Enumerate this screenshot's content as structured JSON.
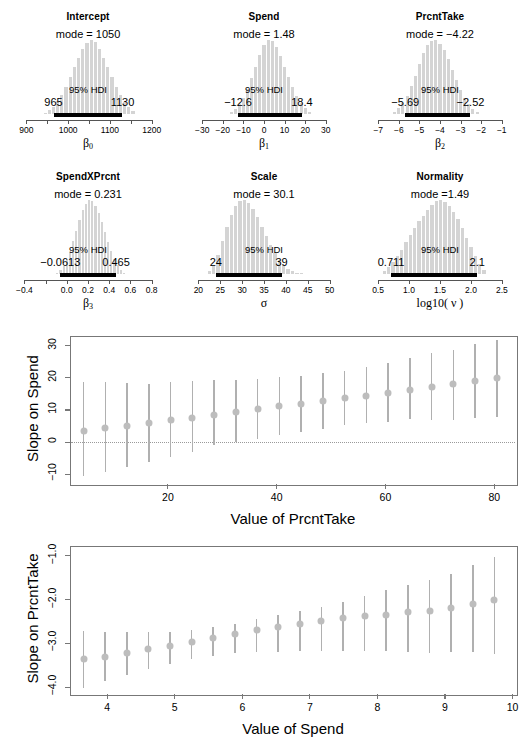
{
  "chart_data": [
    {
      "type": "bar",
      "panel": "posterior-histogram",
      "title": "Intercept",
      "mode_label": "mode = 1050",
      "hdi_label": "95% HDI",
      "hdi_low": "965",
      "hdi_high": "1130",
      "hdi_low_value": 965,
      "hdi_high_value": 1130,
      "mode_value": 1050,
      "xlabel": "β₀",
      "xlabel_base": "β",
      "xlabel_sub": "0",
      "xlim": [
        880,
        1215
      ],
      "ticks": [
        900,
        1000,
        1100,
        1200
      ],
      "ticklabels": [
        "900",
        "1000",
        "1100",
        "1200"
      ],
      "minor_ticks": [
        950,
        1050,
        1150
      ],
      "bin_centers": [
        945,
        955,
        965,
        975,
        985,
        995,
        1005,
        1015,
        1025,
        1035,
        1045,
        1055,
        1065,
        1075,
        1085,
        1095,
        1105,
        1115,
        1125,
        1135,
        1145,
        1155
      ],
      "values": [
        2,
        5,
        10,
        17,
        26,
        37,
        50,
        63,
        76,
        88,
        96,
        100,
        97,
        88,
        76,
        63,
        50,
        37,
        26,
        16,
        9,
        4
      ]
    },
    {
      "type": "bar",
      "panel": "posterior-histogram",
      "title": "Spend",
      "mode_label": "mode = 1.48",
      "hdi_label": "95% HDI",
      "hdi_low": "−12.6",
      "hdi_high": "18.4",
      "hdi_low_value": -12.6,
      "hdi_high_value": 18.4,
      "mode_value": 1.48,
      "xlabel": "β₁",
      "xlabel_base": "β",
      "xlabel_sub": "1",
      "xlim": [
        -34,
        34
      ],
      "ticks": [
        -30,
        -20,
        -10,
        0,
        10,
        20,
        30
      ],
      "ticklabels": [
        "−30",
        "−20",
        "−10",
        "0",
        "10",
        "20",
        "30"
      ],
      "minor_ticks": [],
      "bin_centers": [
        -16,
        -14,
        -12,
        -10,
        -8,
        -6,
        -4,
        -2,
        0,
        2,
        4,
        6,
        8,
        10,
        12,
        14,
        16,
        18,
        20,
        22
      ],
      "values": [
        3,
        7,
        13,
        22,
        34,
        48,
        64,
        80,
        93,
        100,
        98,
        90,
        78,
        64,
        50,
        37,
        25,
        15,
        8,
        3
      ]
    },
    {
      "type": "bar",
      "panel": "posterior-histogram",
      "title": "PrcntTake",
      "mode_label": "mode = −4.22",
      "hdi_label": "95% HDI",
      "hdi_low": "−5.69",
      "hdi_high": "−2.52",
      "hdi_low_value": -5.69,
      "hdi_high_value": -2.52,
      "mode_value": -4.22,
      "xlabel": "β₂",
      "xlabel_base": "β",
      "xlabel_sub": "2",
      "xlim": [
        -7.4,
        -0.6
      ],
      "ticks": [
        -7,
        -6,
        -5,
        -4,
        -3,
        -2,
        -1
      ],
      "ticklabels": [
        "−7",
        "−6",
        "−5",
        "−4",
        "−3",
        "−2",
        "−1"
      ],
      "minor_ticks": [],
      "bin_centers": [
        -6.2,
        -6.0,
        -5.8,
        -5.6,
        -5.4,
        -5.2,
        -5.0,
        -4.8,
        -4.6,
        -4.4,
        -4.2,
        -4.0,
        -3.8,
        -3.6,
        -3.4,
        -3.2,
        -3.0,
        -2.8,
        -2.6,
        -2.4,
        -2.2
      ],
      "values": [
        3,
        8,
        15,
        25,
        38,
        52,
        68,
        82,
        93,
        99,
        100,
        95,
        86,
        74,
        60,
        46,
        33,
        22,
        13,
        7,
        3
      ]
    },
    {
      "type": "bar",
      "panel": "posterior-histogram",
      "title": "SpendXPrcnt",
      "mode_label": "mode = 0.231",
      "hdi_label": "95% HDI",
      "hdi_low": "−0.0613",
      "hdi_high": "0.465",
      "hdi_low_value": -0.0613,
      "hdi_high_value": 0.465,
      "mode_value": 0.231,
      "xlabel": "β₃",
      "xlabel_base": "β",
      "xlabel_sub": "3",
      "xlim": [
        -0.46,
        0.86
      ],
      "ticks": [
        -0.4,
        0.0,
        0.2,
        0.4,
        0.6,
        0.8
      ],
      "ticklabels": [
        "−0.4",
        "0.0",
        "0.2",
        "0.4",
        "0.6",
        "0.8"
      ],
      "minor_ticks": [
        -0.2
      ],
      "bin_centers": [
        -0.09,
        -0.06,
        -0.03,
        0.0,
        0.03,
        0.06,
        0.09,
        0.12,
        0.15,
        0.18,
        0.21,
        0.24,
        0.27,
        0.3,
        0.33,
        0.36,
        0.39,
        0.42,
        0.45,
        0.48,
        0.51,
        0.54
      ],
      "values": [
        2,
        5,
        11,
        19,
        30,
        44,
        58,
        73,
        86,
        95,
        100,
        98,
        92,
        82,
        70,
        57,
        43,
        31,
        20,
        12,
        6,
        2
      ]
    },
    {
      "type": "bar",
      "panel": "posterior-histogram",
      "title": "Scale",
      "mode_label": "mode = 30.1",
      "hdi_label": "95% HDI",
      "hdi_low": "24",
      "hdi_high": "39",
      "hdi_low_value": 24,
      "hdi_high_value": 39,
      "mode_value": 30.1,
      "xlabel": "σ",
      "xlabel_base": "σ",
      "xlabel_sub": "",
      "xlim": [
        19,
        51
      ],
      "ticks": [
        20,
        25,
        30,
        35,
        40,
        45,
        50
      ],
      "ticklabels": [
        "20",
        "25",
        "30",
        "35",
        "40",
        "45",
        "50"
      ],
      "minor_ticks": [],
      "bin_centers": [
        22.5,
        23.5,
        24.5,
        25.5,
        26.5,
        27.5,
        28.5,
        29.5,
        30.5,
        31.5,
        32.5,
        33.5,
        34.5,
        35.5,
        36.5,
        37.5,
        38.5,
        39.5,
        40.5,
        41.5,
        42.5,
        43.5
      ],
      "values": [
        4,
        12,
        26,
        44,
        63,
        80,
        92,
        99,
        100,
        96,
        88,
        77,
        64,
        51,
        39,
        28,
        19,
        12,
        7,
        4,
        2,
        1
      ]
    },
    {
      "type": "bar",
      "panel": "posterior-histogram",
      "title": "Normality",
      "mode_label": "mode =1.49",
      "hdi_label": "95% HDI",
      "hdi_low": "0.711",
      "hdi_high": "2.1",
      "hdi_low_value": 0.711,
      "hdi_high_value": 2.1,
      "mode_value": 1.49,
      "xlabel": "log10( ν )",
      "xlabel_base": "log10( ν )",
      "xlabel_sub": "",
      "xlim": [
        0.37,
        2.63
      ],
      "ticks": [
        0.5,
        1.0,
        1.5,
        2.0,
        2.5
      ],
      "ticklabels": [
        "0.5",
        "1.0",
        "1.5",
        "2.0",
        "2.5"
      ],
      "minor_ticks": [],
      "bin_centers": [
        0.6,
        0.67,
        0.74,
        0.81,
        0.88,
        0.95,
        1.02,
        1.09,
        1.16,
        1.23,
        1.3,
        1.37,
        1.44,
        1.51,
        1.58,
        1.65,
        1.72,
        1.79,
        1.86,
        1.93,
        2.0,
        2.07,
        2.14,
        2.21
      ],
      "values": [
        4,
        9,
        16,
        24,
        33,
        43,
        53,
        62,
        71,
        79,
        86,
        93,
        98,
        100,
        97,
        92,
        84,
        74,
        62,
        49,
        36,
        24,
        14,
        6
      ]
    },
    {
      "type": "scatter",
      "panel": "slope-errorbar",
      "title": "",
      "ylabel": "Slope on Spend",
      "xlabel": "Value of PrcntTake",
      "xlim": [
        2,
        84
      ],
      "ylim": [
        -13,
        33
      ],
      "yticks": [
        -10,
        0,
        10,
        20,
        30
      ],
      "yticklabels": [
        "−10",
        "0",
        "10",
        "20",
        "30"
      ],
      "xticks": [
        20,
        40,
        60,
        80
      ],
      "xticklabels": [
        "20",
        "40",
        "60",
        "80"
      ],
      "zero_line": 0,
      "x": [
        4.5,
        8.5,
        12.5,
        16.5,
        20.5,
        24.5,
        28.5,
        32.5,
        36.5,
        40.5,
        44.5,
        48.5,
        52.5,
        56.5,
        60.5,
        64.5,
        68.5,
        72.5,
        76.5,
        80.5
      ],
      "y": [
        3.4,
        4.3,
        5.1,
        6.0,
        6.9,
        7.6,
        8.6,
        9.4,
        10.2,
        11.1,
        11.9,
        12.7,
        13.7,
        14.5,
        15.4,
        16.2,
        17.1,
        18.0,
        18.9,
        19.8
      ],
      "ylo": [
        -10.6,
        -9.2,
        -7.6,
        -6.2,
        -4.5,
        -3.0,
        -1.0,
        0.2,
        0.9,
        2.3,
        3.1,
        4.1,
        5.2,
        5.9,
        6.4,
        7.3,
        7.0,
        6.9,
        7.4,
        7.7
      ],
      "yhi": [
        18.8,
        18.6,
        18.5,
        18.2,
        18.6,
        18.9,
        19.2,
        19.4,
        19.6,
        20.2,
        20.5,
        21.6,
        22.1,
        23.4,
        24.5,
        26.3,
        27.8,
        28.8,
        30.5,
        31.8
      ]
    },
    {
      "type": "scatter",
      "panel": "slope-errorbar",
      "title": "",
      "ylabel": "Slope on PrcntTake",
      "xlabel": "Value of Spend",
      "xlim": [
        3.45,
        10.05
      ],
      "ylim": [
        -4.15,
        -0.78
      ],
      "yticks": [
        -4.0,
        -3.0,
        -2.0,
        -1.0
      ],
      "yticklabels": [
        "−4.0",
        "−3.0",
        "−2.0",
        "−1.0"
      ],
      "xticks": [
        4,
        5,
        6,
        7,
        8,
        9,
        10
      ],
      "xticklabels": [
        "4",
        "5",
        "6",
        "7",
        "8",
        "9",
        "10"
      ],
      "zero_line": null,
      "x": [
        3.65,
        3.97,
        4.29,
        4.61,
        4.93,
        5.25,
        5.57,
        5.89,
        6.21,
        6.53,
        6.85,
        7.17,
        7.49,
        7.81,
        8.13,
        8.45,
        8.77,
        9.09,
        9.41,
        9.73
      ],
      "y": [
        -3.36,
        -3.3,
        -3.22,
        -3.13,
        -3.05,
        -2.96,
        -2.88,
        -2.78,
        -2.7,
        -2.62,
        -2.55,
        -2.49,
        -2.43,
        -2.38,
        -2.34,
        -2.29,
        -2.26,
        -2.2,
        -2.11,
        -2.02
      ],
      "ylo": [
        -4.02,
        -3.86,
        -3.72,
        -3.58,
        -3.46,
        -3.36,
        -3.28,
        -3.22,
        -3.2,
        -3.19,
        -3.18,
        -3.18,
        -3.18,
        -3.18,
        -3.18,
        -3.2,
        -3.21,
        -3.19,
        -3.2,
        -3.24
      ],
      "yhi": [
        -2.72,
        -2.73,
        -2.73,
        -2.73,
        -2.73,
        -2.7,
        -2.63,
        -2.56,
        -2.45,
        -2.35,
        -2.26,
        -2.16,
        -2.05,
        -1.92,
        -1.78,
        -1.67,
        -1.55,
        -1.42,
        -1.22,
        -1.03
      ]
    }
  ]
}
